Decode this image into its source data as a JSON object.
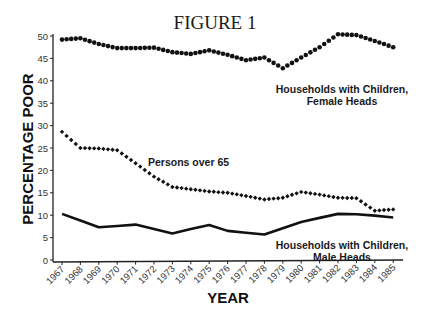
{
  "chart_data": {
    "type": "line",
    "title": "FIGURE 1",
    "xlabel": "YEAR",
    "ylabel": "PERCENTAGE POOR",
    "ylim": [
      0,
      50
    ],
    "yticks": [
      0,
      5,
      10,
      15,
      20,
      25,
      30,
      35,
      40,
      45,
      50
    ],
    "grid": false,
    "legend": "inline annotations",
    "categories": [
      "1967",
      "1968",
      "1969",
      "1970",
      "1971",
      "1972",
      "1973",
      "1974",
      "1975",
      "1976",
      "1977",
      "1978",
      "1979",
      "1980",
      "1981",
      "1982",
      "1983",
      "1984",
      "1985"
    ],
    "series": [
      {
        "name": "Households with Children, Female Heads",
        "label_lines": [
          "Households with Children,",
          "Female Heads"
        ],
        "style": "round-dots",
        "values": [
          49.2,
          49.5,
          48.2,
          47.3,
          47.3,
          47.4,
          46.4,
          46.0,
          46.8,
          45.8,
          44.6,
          45.2,
          42.8,
          45.2,
          47.5,
          50.4,
          50.2,
          48.9,
          47.5
        ]
      },
      {
        "name": "Persons over 65",
        "label_lines": [
          "Persons over 65"
        ],
        "style": "diamond-dots",
        "values": [
          28.6,
          25.0,
          24.9,
          24.5,
          21.6,
          18.6,
          16.3,
          15.8,
          15.3,
          15.0,
          14.3,
          13.5,
          13.9,
          15.2,
          14.6,
          13.9,
          13.8,
          11.0,
          11.3
        ]
      },
      {
        "name": "Households with Children, Male Heads",
        "label_lines": [
          "Households with Children,",
          "Male Heads"
        ],
        "style": "solid-line",
        "values": [
          10.3,
          8.8,
          7.3,
          7.6,
          7.9,
          6.9,
          5.9,
          6.9,
          7.8,
          6.5,
          6.1,
          5.7,
          7.1,
          8.5,
          9.4,
          10.3,
          10.2,
          9.9,
          9.5
        ]
      }
    ]
  },
  "figure": {
    "title": "FIGURE 1",
    "xlabel": "YEAR",
    "ylabel": "PERCENTAGE POOR",
    "labels": {
      "female_1": "Households with Children,",
      "female_2": "Female Heads",
      "elderly": "Persons over 65",
      "male_1": "Households with Children,",
      "male_2": "Male Heads"
    }
  }
}
